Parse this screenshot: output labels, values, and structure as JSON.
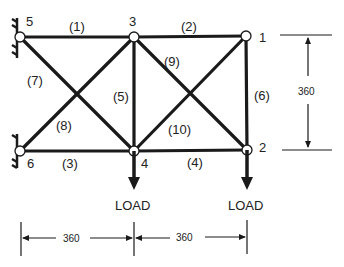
{
  "diagram": {
    "type": "ten-bar truss",
    "nodes": [
      {
        "id": "1",
        "label": "1",
        "x": 246,
        "y": 36
      },
      {
        "id": "2",
        "label": "2",
        "x": 247,
        "y": 150
      },
      {
        "id": "3",
        "label": "3",
        "x": 134,
        "y": 37
      },
      {
        "id": "4",
        "label": "4",
        "x": 134,
        "y": 151
      },
      {
        "id": "5",
        "label": "5",
        "x": 20,
        "y": 37
      },
      {
        "id": "6",
        "label": "6",
        "x": 20,
        "y": 151
      }
    ],
    "members": [
      {
        "label": "(1)",
        "from": "5",
        "to": "3"
      },
      {
        "label": "(2)",
        "from": "3",
        "to": "1"
      },
      {
        "label": "(3)",
        "from": "6",
        "to": "4"
      },
      {
        "label": "(4)",
        "from": "4",
        "to": "2"
      },
      {
        "label": "(5)",
        "from": "3",
        "to": "4"
      },
      {
        "label": "(6)",
        "from": "1",
        "to": "2"
      },
      {
        "label": "(7)",
        "from": "5",
        "to": "4"
      },
      {
        "label": "(8)",
        "from": "6",
        "to": "3"
      },
      {
        "label": "(9)",
        "from": "3",
        "to": "2"
      },
      {
        "label": "(10)",
        "from": "4",
        "to": "1"
      }
    ],
    "supports": [
      "5",
      "6"
    ],
    "loads": [
      {
        "node": "4",
        "label": "LOAD"
      },
      {
        "node": "2",
        "label": "LOAD"
      }
    ],
    "dimensions": {
      "height": "360",
      "span_left": "360",
      "span_right": "360"
    },
    "colors": {
      "line": "#1a1a1a",
      "node_fill": "#ffffff"
    }
  }
}
